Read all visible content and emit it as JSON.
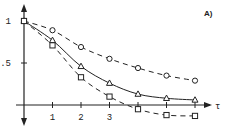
{
  "chart_data": {
    "type": "line",
    "title": "",
    "panel_label": "A)",
    "xlabel": "τ",
    "ylabel": "",
    "xlim": [
      0,
      6.8
    ],
    "ylim": [
      -0.2,
      1.2
    ],
    "x_ticks": [
      1,
      2,
      3
    ],
    "x_tick_labels": [
      "1",
      "2",
      "3"
    ],
    "y_ticks": [
      0.5,
      1
    ],
    "y_tick_labels": [
      ".5",
      "1"
    ],
    "grid": false,
    "legend": "none",
    "x": [
      0,
      1,
      2,
      3,
      4,
      5,
      6
    ],
    "series": [
      {
        "name": "circles",
        "marker": "circle",
        "line": "dashed",
        "values": [
          1.0,
          0.89,
          0.69,
          0.55,
          0.44,
          0.35,
          0.29
        ]
      },
      {
        "name": "triangles",
        "marker": "triangle",
        "line": "solid",
        "values": [
          1.0,
          0.77,
          0.46,
          0.26,
          0.13,
          0.08,
          0.06
        ]
      },
      {
        "name": "squares",
        "marker": "square",
        "line": "dashed",
        "values": [
          1.0,
          0.71,
          0.33,
          0.1,
          -0.05,
          -0.12,
          -0.13
        ]
      }
    ],
    "colors": {
      "ink": "#222222",
      "background": "#ffffff"
    }
  }
}
